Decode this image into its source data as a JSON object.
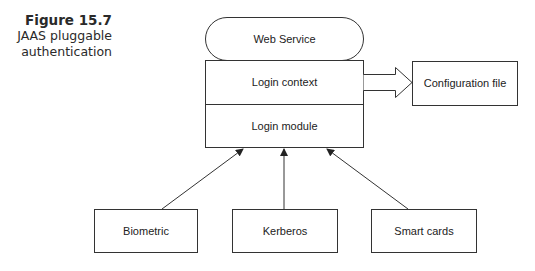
{
  "caption": {
    "figure_number": "Figure 15.7",
    "title_line1": "JAAS pluggable",
    "title_line2": "authentication"
  },
  "diagram": {
    "nodes": {
      "web_service": "Web Service",
      "login_context": "Login context",
      "login_module": "Login module",
      "configuration_file": "Configuration file",
      "biometric": "Biometric",
      "kerberos": "Kerberos",
      "smart_cards": "Smart cards"
    },
    "edges": [
      {
        "from": "login_context",
        "to": "configuration_file",
        "style": "block-arrow"
      },
      {
        "from": "biometric",
        "to": "login_module",
        "style": "arrow"
      },
      {
        "from": "kerberos",
        "to": "login_module",
        "style": "arrow"
      },
      {
        "from": "smart_cards",
        "to": "login_module",
        "style": "arrow"
      }
    ]
  }
}
